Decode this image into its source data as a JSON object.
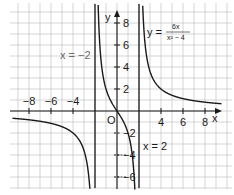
{
  "chart_data": {
    "type": "line",
    "title": "",
    "function_label": {
      "lhs": "y =",
      "numerator": "6x",
      "denominator": "x² − 4"
    },
    "xlabel": "x",
    "ylabel": "y",
    "origin_label": "O",
    "xlim": [
      -9.5,
      10.3
    ],
    "ylim": [
      -7,
      10
    ],
    "grid": true,
    "x_ticks": [
      -8,
      -6,
      -4,
      4,
      6,
      8
    ],
    "x_tick_labels": [
      "−8",
      "−6",
      "−4",
      "4",
      "6",
      "8"
    ],
    "y_ticks": [
      8,
      6,
      4,
      2,
      -2,
      -4,
      -6
    ],
    "y_tick_labels": [
      "8",
      "6",
      "4",
      "2",
      "−2",
      "−4",
      "−6"
    ],
    "asymptotes": [
      {
        "x": -2,
        "label": "x = −2"
      },
      {
        "x": 2,
        "label": "x = 2"
      }
    ],
    "series": [
      {
        "name": "y = 6x/(x²−4)",
        "formula": "6*x/(x*x-4)",
        "branches": [
          [
            -9.5,
            -2
          ],
          [
            -2,
            2
          ],
          [
            2,
            9.5
          ]
        ]
      }
    ]
  },
  "colors": {
    "grid": "#b8b8b8",
    "axis": "#1a1a1a",
    "curve": "#1a1a1a",
    "asymptote": "#1a1a1a",
    "gray_label": "#6a6a6a"
  }
}
